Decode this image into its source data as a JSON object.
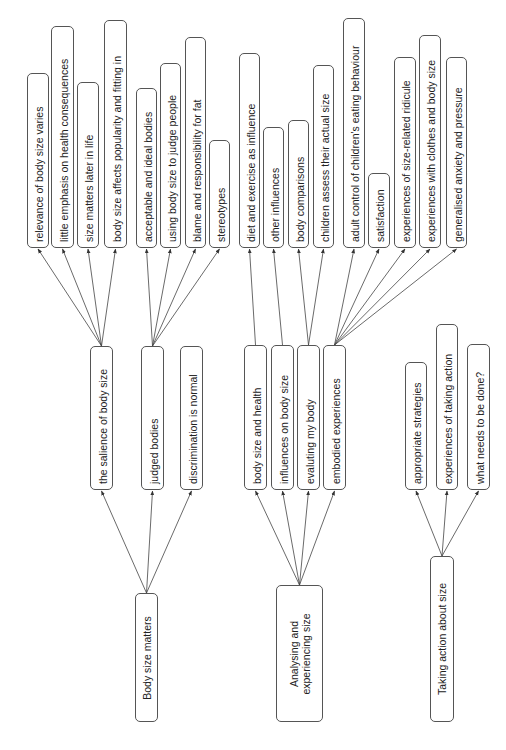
{
  "diagram": {
    "type": "hierarchical thematic map (rotated 90°)",
    "line_color": "#444444",
    "border_color": "#555555",
    "themes": [
      {
        "id": "t1",
        "label": "Body size matters",
        "box": [
          135,
          593,
          23,
          129
        ],
        "subthemes": [
          {
            "id": "s1",
            "label": "the salience of body size",
            "box": [
              90,
              346,
              23,
              144
            ],
            "codes": [
              {
                "id": "c1",
                "label": "relevance of body size varies",
                "box": [
                  27,
                  73,
                  22,
                  175
                ]
              },
              {
                "id": "c2",
                "label": "little emphasis on health consequences",
                "box": [
                  51,
                  26,
                  23,
                  222
                ]
              },
              {
                "id": "c3",
                "label": "size matters later in life",
                "box": [
                  77,
                  82,
                  22,
                  166
                ]
              },
              {
                "id": "c4",
                "label": "body size affects popularity and fitting in",
                "box": [
                  104,
                  20,
                  23,
                  228
                ]
              }
            ]
          },
          {
            "id": "s2",
            "label": "judged bodies",
            "box": [
              141,
              346,
              23,
              144
            ],
            "codes": [
              {
                "id": "c5",
                "label": "acceptable and ideal bodies",
                "box": [
                  136,
                  88,
                  21,
                  160
                ]
              },
              {
                "id": "c6",
                "label": "using body size to judge people",
                "box": [
                  160,
                  63,
                  21,
                  185
                ]
              },
              {
                "id": "c7",
                "label": "blame and responsibility for fat",
                "box": [
                  185,
                  37,
                  21,
                  211
                ]
              },
              {
                "id": "c8",
                "label": "stereotypes",
                "box": [
                  209,
                  140,
                  21,
                  108
                ]
              }
            ]
          },
          {
            "id": "s3",
            "label": "discrimination is normal",
            "box": [
              180,
              346,
              23,
              144
            ],
            "codes": []
          }
        ]
      },
      {
        "id": "t2",
        "label_lines": [
          "Analysing and",
          "experiencing size"
        ],
        "box": [
          276,
          585,
          47,
          137
        ],
        "subthemes": [
          {
            "id": "s4",
            "label": "body size and health",
            "box": [
              244,
              345,
              23,
              145
            ],
            "codes": [
              {
                "id": "c9",
                "label": "diet and exercise as influence",
                "box": [
                  239,
                  53,
                  21,
                  195
                ]
              }
            ]
          },
          {
            "id": "s5",
            "label": "influences on body size",
            "box": [
              271,
              345,
              23,
              145
            ],
            "codes": [
              {
                "id": "c10",
                "label": "other influences",
                "box": [
                  263,
                  127,
                  21,
                  121
                ]
              }
            ]
          },
          {
            "id": "s6",
            "label": "evaluting my body",
            "box": [
              297,
              345,
              23,
              145
            ],
            "codes": [
              {
                "id": "c11",
                "label": "body comparisons",
                "box": [
                  288,
                  120,
                  21,
                  128
                ]
              },
              {
                "id": "c12",
                "label": "children assess their actual size",
                "box": [
                  313,
                  65,
                  21,
                  183
                ]
              }
            ]
          },
          {
            "id": "s7",
            "label": "embodied experiences",
            "box": [
              323,
              345,
              23,
              145
            ],
            "codes": [
              {
                "id": "c13",
                "label": "adult control of children's eating behaviour",
                "box": [
                  343,
                  18,
                  22,
                  230
                ]
              },
              {
                "id": "c14",
                "label": "satisfaction",
                "box": [
                  368,
                  173,
                  22,
                  75
                ]
              },
              {
                "id": "c15",
                "label": "experiences of size-related ridicule",
                "box": [
                  394,
                  57,
                  22,
                  191
                ]
              },
              {
                "id": "c16",
                "label": "experiences with clothes and body size",
                "box": [
                  419,
                  35,
                  22,
                  213
                ]
              },
              {
                "id": "c17",
                "label": "generalised anxiety and pressure",
                "box": [
                  446,
                  57,
                  21,
                  191
                ]
              }
            ]
          }
        ]
      },
      {
        "id": "t3",
        "label": "Taking action about size",
        "box": [
          430,
          556,
          24,
          166
        ],
        "subthemes": [
          {
            "id": "s8",
            "label": "appropriate strategies",
            "box": [
              405,
              362,
              22,
              128
            ],
            "codes": []
          },
          {
            "id": "s9",
            "label": "experiences of taking action",
            "box": [
              436,
              324,
              22,
              166
            ],
            "codes": []
          },
          {
            "id": "s10",
            "label": "what needs to be done?",
            "box": [
              467,
              344,
              23,
              146
            ],
            "codes": []
          }
        ]
      }
    ]
  }
}
